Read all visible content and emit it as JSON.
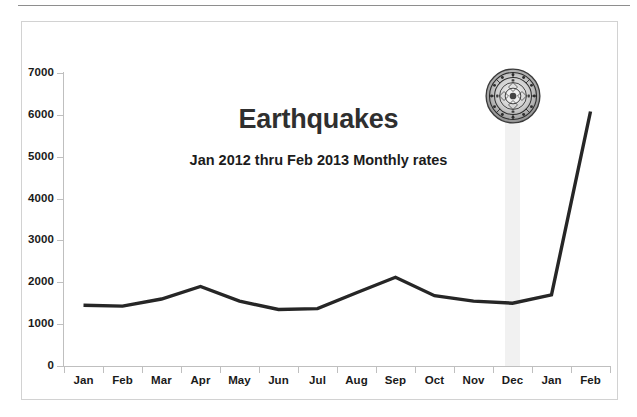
{
  "chart_data": {
    "type": "line",
    "title": "Earthquakes",
    "subtitle": "Jan 2012 thru Feb 2013 Monthly rates",
    "xlabel": "",
    "ylabel": "",
    "categories": [
      "Jan",
      "Feb",
      "Mar",
      "Apr",
      "May",
      "Jun",
      "Jul",
      "Aug",
      "Sep",
      "Oct",
      "Nov",
      "Dec",
      "Jan",
      "Feb"
    ],
    "values": [
      1450,
      1430,
      1600,
      1900,
      1550,
      1350,
      1370,
      1750,
      2120,
      1680,
      1550,
      1500,
      1700,
      6080
    ],
    "series": [
      {
        "name": "Monthly earthquake count",
        "values": [
          1450,
          1430,
          1600,
          1900,
          1550,
          1350,
          1370,
          1750,
          2120,
          1680,
          1550,
          1500,
          1700,
          6080
        ]
      }
    ],
    "ylim": [
      0,
      7000
    ],
    "y_ticks": [
      0,
      1000,
      2000,
      3000,
      4000,
      5000,
      6000,
      7000
    ],
    "y_tick_labels": [
      "0",
      "1000",
      "2000",
      "3000",
      "4000",
      "5000",
      "6000",
      "7000"
    ],
    "grid": false,
    "legend": "none",
    "line_color": "#262626",
    "line_width": 3.4,
    "highlight": {
      "category": "Dec",
      "band_color": "#f1f1f1",
      "note": "aztec-calendar-stone medallion above December"
    }
  },
  "chart": {
    "title": "Earthquakes",
    "subtitle": "Jan 2012 thru Feb 2013 Monthly rates",
    "annotation_icon": "aztec-calendar-stone-icon"
  }
}
